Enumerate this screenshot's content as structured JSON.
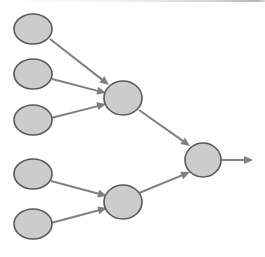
{
  "diagram": {
    "type": "node-link-graph",
    "canvas": {
      "width": 265,
      "height": 257,
      "background": "#ffffff"
    },
    "style": {
      "node_fill": "#cccccc",
      "node_stroke": "#595959",
      "node_stroke_width": 1.6,
      "edge_stroke": "#808080",
      "edge_stroke_width": 2.0,
      "arrowhead_fill": "#808080",
      "arrowhead_length": 9,
      "arrowhead_width": 8
    },
    "layers": [
      {
        "name": "input-layer",
        "label": "Input layer",
        "node_count": 5
      },
      {
        "name": "hidden-layer",
        "label": "Hidden layer",
        "node_count": 2
      },
      {
        "name": "output-layer",
        "label": "Output layer",
        "node_count": 1
      }
    ],
    "nodes": [
      {
        "id": "in1",
        "name": "input-node-1",
        "layer": "input-layer",
        "shape": "ellipse",
        "cx": 33,
        "cy": 29,
        "rx": 19,
        "ry": 15
      },
      {
        "id": "in2",
        "name": "input-node-2",
        "layer": "input-layer",
        "shape": "ellipse",
        "cx": 33,
        "cy": 74,
        "rx": 19,
        "ry": 15
      },
      {
        "id": "in3",
        "name": "input-node-3",
        "layer": "input-layer",
        "shape": "ellipse",
        "cx": 33,
        "cy": 120,
        "rx": 19,
        "ry": 15
      },
      {
        "id": "in4",
        "name": "input-node-4",
        "layer": "input-layer",
        "shape": "ellipse",
        "cx": 33,
        "cy": 174,
        "rx": 19,
        "ry": 15
      },
      {
        "id": "in5",
        "name": "input-node-5",
        "layer": "input-layer",
        "shape": "ellipse",
        "cx": 33,
        "cy": 224,
        "rx": 19,
        "ry": 15
      },
      {
        "id": "h1",
        "name": "hidden-node-1",
        "layer": "hidden-layer",
        "shape": "ellipse",
        "cx": 123,
        "cy": 98,
        "rx": 19,
        "ry": 17
      },
      {
        "id": "h2",
        "name": "hidden-node-2",
        "layer": "hidden-layer",
        "shape": "ellipse",
        "cx": 123,
        "cy": 202,
        "rx": 19,
        "ry": 17
      },
      {
        "id": "out1",
        "name": "output-node-1",
        "layer": "output-layer",
        "shape": "ellipse",
        "cx": 203,
        "cy": 160,
        "rx": 18,
        "ry": 17
      }
    ],
    "edges": [
      {
        "id": "e1",
        "name": "edge-input-1-to-hidden-1",
        "from": "in1",
        "to": "h1",
        "x1": 50,
        "y1": 39,
        "x2": 109,
        "y2": 85,
        "arrow": true
      },
      {
        "id": "e2",
        "name": "edge-input-2-to-hidden-1",
        "from": "in2",
        "to": "h1",
        "x1": 52,
        "y1": 79,
        "x2": 106,
        "y2": 93,
        "arrow": true
      },
      {
        "id": "e3",
        "name": "edge-input-3-to-hidden-1",
        "from": "in3",
        "to": "h1",
        "x1": 51,
        "y1": 118,
        "x2": 106,
        "y2": 104,
        "arrow": true
      },
      {
        "id": "e4",
        "name": "edge-input-4-to-hidden-2",
        "from": "in4",
        "to": "h2",
        "x1": 51,
        "y1": 181,
        "x2": 107,
        "y2": 196,
        "arrow": true
      },
      {
        "id": "e5",
        "name": "edge-input-5-to-hidden-2",
        "from": "in5",
        "to": "h2",
        "x1": 51,
        "y1": 223,
        "x2": 107,
        "y2": 208,
        "arrow": true
      },
      {
        "id": "e6",
        "name": "edge-hidden-1-to-output-1",
        "from": "h1",
        "to": "out1",
        "x1": 139,
        "y1": 110,
        "x2": 190,
        "y2": 146,
        "arrow": true
      },
      {
        "id": "e7",
        "name": "edge-hidden-2-to-output-1",
        "from": "h2",
        "to": "out1",
        "x1": 139,
        "y1": 193,
        "x2": 190,
        "y2": 172,
        "arrow": true
      },
      {
        "id": "e8",
        "name": "edge-output-1-to-sink",
        "from": "out1",
        "to": null,
        "x1": 221,
        "y1": 160,
        "x2": 253,
        "y2": 160,
        "arrow": true
      }
    ]
  }
}
